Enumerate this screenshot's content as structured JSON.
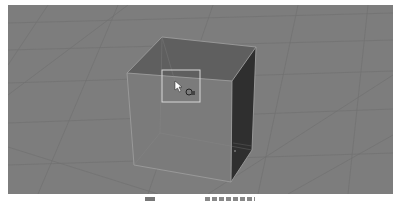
{
  "viewport": {
    "background": "#7d7d7d",
    "grid_color": "#6e6e6e",
    "object": {
      "type": "cube",
      "colors": {
        "front_face": "#7b7b7b",
        "top_face": "#5f5f5f",
        "right_face": "#2f2f2f",
        "edges": "#9a9a9a"
      }
    },
    "selection_rect": {
      "x": 154,
      "y": 65,
      "width": 38,
      "height": 32,
      "color": "#d8d8d8"
    },
    "cursor": {
      "x": 169,
      "y": 79
    },
    "rotate_icon": "rotate-icon"
  },
  "caption": {
    "text": ""
  }
}
